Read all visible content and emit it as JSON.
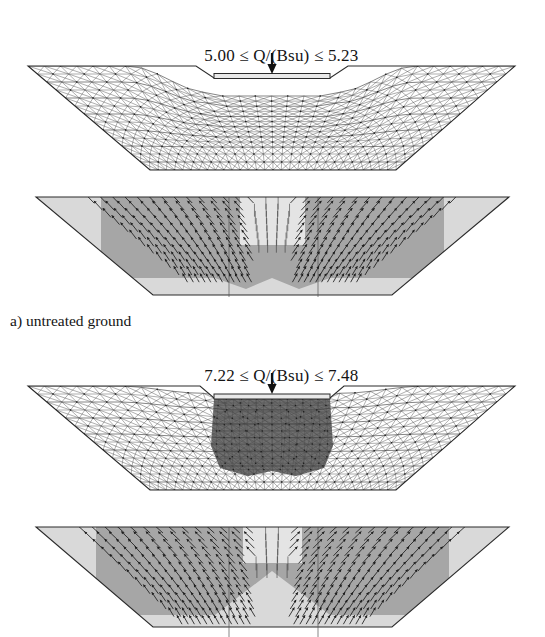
{
  "figure": {
    "width": 545,
    "height": 637,
    "background": "#ffffff",
    "type": "finite-element-analysis-figure"
  },
  "panels": [
    {
      "id": "panel-a-mesh",
      "kind": "deformed-mesh",
      "caption": "5.00 ≤ Q/(Bsu) ≤ 5.23",
      "caption_parts": {
        "lower_bound": "5.00",
        "relation_left": "≤",
        "variable": "Q/(Bsu)",
        "relation_right": "≤",
        "upper_bound": "5.23"
      },
      "load_arrow": "downward-point-load",
      "footing": "rigid-strip-footing",
      "treated_block": false
    },
    {
      "id": "panel-a-velocity",
      "kind": "velocity-field",
      "caption": "",
      "zones": [
        "zone-light",
        "zone-mid"
      ],
      "mechanism": "two symmetric rotating fans flanking central vertical flow"
    },
    {
      "id": "panel-b-mesh",
      "kind": "deformed-mesh",
      "caption": "7.22 ≤ Q/(Bsu) ≤ 7.48",
      "caption_parts": {
        "lower_bound": "7.22",
        "relation_left": "≤",
        "variable": "Q/(Bsu)",
        "relation_right": "≤",
        "upper_bound": "7.48"
      },
      "load_arrow": "downward-point-load",
      "footing": "rigid-strip-footing",
      "treated_block": true
    },
    {
      "id": "panel-b-velocity",
      "kind": "velocity-field",
      "caption": "",
      "zones": [
        "zone-light",
        "zone-mid"
      ],
      "mechanism": "deeper wider V-shaped mechanism with central block translation"
    }
  ],
  "labels": {
    "subfigure_a": "a) untreated ground"
  },
  "colors": {
    "zone_light": "#d9d9d9",
    "zone_mid": "#a6a6a6",
    "treated_block": "#6f6f6f",
    "mesh_line": "#4c4c4c",
    "vector": "#1d1d1d",
    "text": "#141414"
  },
  "chart_data": {
    "type": "table",
    "categories": [
      "untreated ground",
      "treated ground"
    ],
    "series": [
      {
        "name": "lower bound Q/(Bsu)",
        "values": [
          5.0,
          7.22
        ]
      },
      {
        "name": "upper bound Q/(Bsu)",
        "values": [
          5.23,
          7.48
        ]
      }
    ],
    "ylabel": "Q/(Bsu)",
    "xlabel": ""
  }
}
